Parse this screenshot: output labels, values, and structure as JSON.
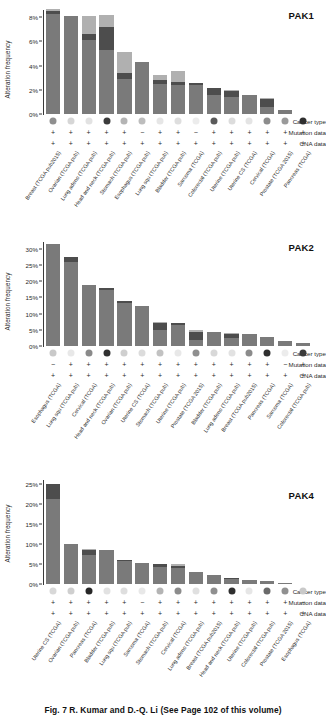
{
  "figure": {
    "caption": "Fig. 7  R. Kumar and D.-Q. Li (See Page 102 of this volume)",
    "y_axis_label": "Alteration frequency",
    "annotation_rows": [
      "Cancer type",
      "Mutation data",
      "CNA data"
    ],
    "colors": {
      "bar_amplification": "#7a7a7a",
      "bar_mutation": "#4d4d4d",
      "bar_deletion": "#b0b0b0",
      "bar_multiple": "#3a3a3a",
      "axis": "#3a3a3a",
      "text": "#2a2a2a"
    }
  },
  "chart_data": [
    {
      "type": "bar",
      "title": "PAK1",
      "ylabel": "Alteration frequency",
      "xlabel": "",
      "ylim": [
        0,
        8.6
      ],
      "yticks": [
        "0%",
        "2%",
        "4%",
        "6%",
        "8%"
      ],
      "ytick_values": [
        0,
        2,
        4,
        6,
        8
      ],
      "grid": false,
      "stacked": true,
      "categories": [
        "Breast (TCGA pub2015)",
        "Ovarian (TCGA pub)",
        "Lung adeno (TCGA pub)",
        "Head and neck (TCGA pub)",
        "Stomach (TCGA pub)",
        "Esophagus (TCGA pub)",
        "Lung squ (TCGA pub)",
        "Bladder (TCGA pub)",
        "Sarcoma (TCGA)",
        "Colorectal (TCGA pub)",
        "Uterine (TCGA pub)",
        "Uterine CS (TCGA)",
        "Cervical (TCGA)",
        "Prostate (TCGA 2015)",
        "Pancreas (TCGA)"
      ],
      "series": [
        {
          "name": "Amplification",
          "values": [
            8.3,
            8.1,
            6.1,
            5.3,
            2.9,
            4.3,
            2.5,
            2.4,
            2.4,
            1.6,
            1.4,
            1.6,
            0.6,
            0.35,
            0.0
          ]
        },
        {
          "name": "Mutation",
          "values": [
            0.25,
            0.0,
            0.5,
            1.9,
            0.5,
            0.0,
            0.35,
            0.25,
            0.2,
            0.55,
            0.5,
            0.0,
            0.65,
            0.0,
            0.0
          ]
        },
        {
          "name": "Deletion",
          "values": [
            0.15,
            0.0,
            1.5,
            1.0,
            1.7,
            0.0,
            0.4,
            0.9,
            0.0,
            0.0,
            0.05,
            0.0,
            0.1,
            0.0,
            0.0
          ]
        }
      ],
      "totals": [
        8.7,
        8.1,
        8.1,
        8.2,
        5.1,
        4.3,
        3.25,
        3.55,
        2.6,
        2.15,
        1.95,
        1.6,
        1.35,
        0.35,
        0.0
      ],
      "cancer_type_shades": [
        "#8f8f8f",
        "#d6d6d6",
        "#e2e2e2",
        "#3b3b3b",
        "#b4b4b4",
        "#bdbdbd",
        "#e6e6e6",
        "#dedede",
        "#ececec",
        "#5a5a5a",
        "#dcdcdc",
        "#e4e4e4",
        "#8c8c8c",
        "#9a9a9a",
        "#2f2f2f"
      ],
      "mutation_data": [
        "+",
        "+",
        "+",
        "+",
        "+",
        "−",
        "+",
        "+",
        "−",
        "+",
        "+",
        "+",
        "+",
        "+",
        "+"
      ],
      "cna_data": [
        "+",
        "+",
        "+",
        "+",
        "+",
        "+",
        "+",
        "+",
        "+",
        "+",
        "+",
        "+",
        "+",
        "+",
        "+"
      ]
    },
    {
      "type": "bar",
      "title": "PAK2",
      "ylabel": "Alteration frequency",
      "xlabel": "",
      "ylim": [
        0,
        32
      ],
      "yticks": [
        "0%",
        "5%",
        "10%",
        "15%",
        "20%",
        "25%",
        "30%"
      ],
      "ytick_values": [
        0,
        5,
        10,
        15,
        20,
        25,
        30
      ],
      "grid": false,
      "stacked": true,
      "categories": [
        "Esophagus (TCGA)",
        "Lung squ (TCGA pub)",
        "Cervical (TCGA)",
        "Head and neck (TCGA pub)",
        "Ovarian (TCGA pub)",
        "Uterine CS (TCGA)",
        "Stomach (TCGA pub)",
        "Uterine (TCGA pub)",
        "Prostate (TCGA 2015)",
        "Bladder (TCGA pub)",
        "Lung adeno (TCGA pub)",
        "Breast (TCGA pub2015)",
        "Pancreas (TCGA)",
        "Sarcoma (TCGA)",
        "Colorectal (TCGA pub)"
      ],
      "series": [
        {
          "name": "Amplification",
          "values": [
            31.5,
            26.0,
            18.7,
            17.2,
            13.3,
            12.2,
            5.0,
            6.6,
            2.0,
            4.3,
            2.5,
            3.6,
            2.9,
            1.4,
            0.8
          ]
        },
        {
          "name": "Mutation",
          "values": [
            0.0,
            1.3,
            0.0,
            0.6,
            0.5,
            0.0,
            2.2,
            0.4,
            2.2,
            0.0,
            1.3,
            0.1,
            0.0,
            0.0,
            0.0
          ]
        },
        {
          "name": "Deletion",
          "values": [
            0.0,
            0.1,
            0.0,
            0.2,
            0.2,
            0.0,
            0.2,
            0.2,
            0.6,
            0.0,
            0.1,
            0.1,
            0.0,
            0.0,
            0.0
          ]
        }
      ],
      "totals": [
        31.5,
        27.4,
        18.7,
        18.0,
        14.0,
        12.2,
        7.4,
        7.2,
        4.8,
        4.3,
        3.9,
        3.8,
        2.9,
        1.4,
        0.8
      ],
      "cancer_type_shades": [
        "#c9c9c9",
        "#e8e8e8",
        "#8a8a8a",
        "#303030",
        "#cfcfcf",
        "#dcdcdc",
        "#c2c2c2",
        "#e8e8e8",
        "#8f8f8f",
        "#d8d8d8",
        "#e2e2e2",
        "#8b8b8b",
        "#2f2f2f",
        "#ececec",
        "#3b3b3b"
      ],
      "mutation_data": [
        "−",
        "+",
        "+",
        "+",
        "+",
        "+",
        "+",
        "+",
        "+",
        "+",
        "+",
        "+",
        "+",
        "−",
        "+"
      ],
      "cna_data": [
        "+",
        "+",
        "+",
        "+",
        "+",
        "+",
        "+",
        "+",
        "+",
        "+",
        "+",
        "+",
        "+",
        "+",
        "+"
      ]
    },
    {
      "type": "bar",
      "title": "PAK4",
      "ylabel": "Alteration frequency",
      "xlabel": "",
      "ylim": [
        0,
        26
      ],
      "yticks": [
        "0%",
        "5%",
        "10%",
        "15%",
        "20%",
        "25%"
      ],
      "ytick_values": [
        0,
        5,
        10,
        15,
        20,
        25
      ],
      "grid": false,
      "stacked": true,
      "categories": [
        "Uterine CS (TCGA)",
        "Ovarian (TCGA pub)",
        "Pancreas (TCGA)",
        "Bladder (TCGA pub)",
        "Lung squ (TCGA pub)",
        "Sarcoma (TCGA)",
        "Stomach (TCGA pub)",
        "Cervical (TCGA)",
        "Lung adeno (TCGA pub)",
        "Breast (TCGA pub2015)",
        "Head and neck (TCGA pub)",
        "Uterine (TCGA pub)",
        "Colorectal (TCGA pub)",
        "Prostate (TCGA 2015)",
        "Esophagus (TCGA)"
      ],
      "series": [
        {
          "name": "Amplification",
          "values": [
            21.2,
            10.0,
            7.2,
            8.5,
            5.8,
            5.3,
            4.3,
            4.0,
            3.1,
            2.3,
            1.3,
            1.0,
            0.8,
            0.15,
            0.0
          ]
        },
        {
          "name": "Mutation",
          "values": [
            3.8,
            0.0,
            1.3,
            0.0,
            0.1,
            0.0,
            0.6,
            0.4,
            0.0,
            0.0,
            0.3,
            0.0,
            0.0,
            0.0,
            0.0
          ]
        },
        {
          "name": "Deletion",
          "values": [
            0.0,
            0.0,
            0.3,
            0.0,
            0.1,
            0.0,
            0.1,
            0.5,
            0.0,
            0.0,
            0.0,
            0.0,
            0.0,
            0.0,
            0.0
          ]
        }
      ],
      "totals": [
        25.0,
        10.0,
        8.8,
        8.5,
        6.0,
        5.3,
        5.0,
        4.9,
        3.1,
        2.3,
        1.6,
        1.0,
        0.8,
        0.15,
        0.0
      ],
      "cancer_type_shades": [
        "#d8d8d8",
        "#cfcfcf",
        "#272727",
        "#e2e2e2",
        "#dedede",
        "#e8e8e8",
        "#b4b4b4",
        "#8c8c8c",
        "#e0e0e0",
        "#8f8f8f",
        "#2f2f2f",
        "#e6e6e6",
        "#6a6a6a",
        "#909090",
        "#c9c9c9"
      ],
      "mutation_data": [
        "+",
        "+",
        "+",
        "+",
        "+",
        "−",
        "+",
        "+",
        "+",
        "+",
        "+",
        "+",
        "+",
        "+",
        "−"
      ],
      "cna_data": [
        "+",
        "+",
        "+",
        "+",
        "+",
        "+",
        "+",
        "+",
        "+",
        "+",
        "+",
        "+",
        "+",
        "+",
        "+"
      ]
    }
  ]
}
